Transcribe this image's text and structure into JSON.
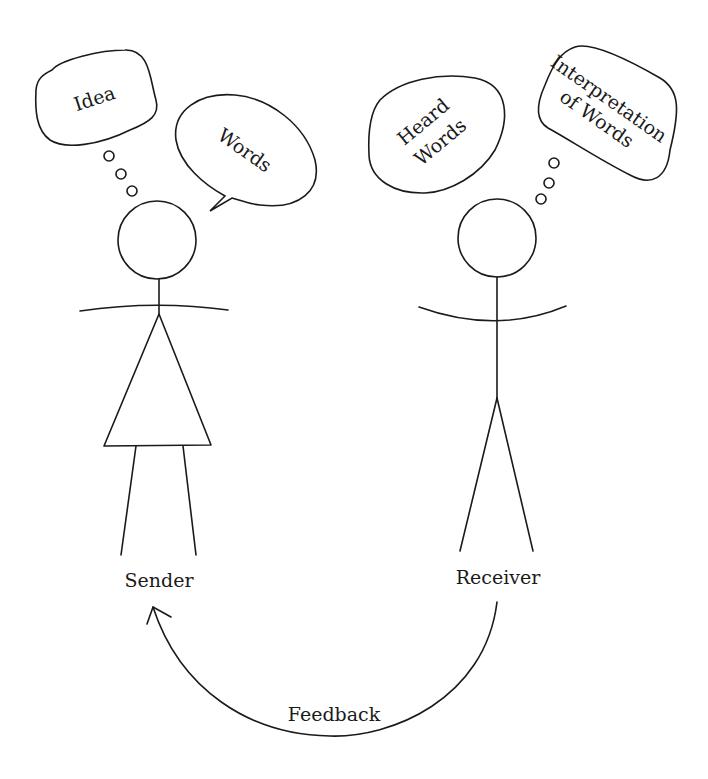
{
  "diagram": {
    "colors": {
      "line": "#1a1a1a",
      "background": "#ffffff"
    },
    "sender": {
      "label": "Sender",
      "thought_bubble": {
        "text": "Idea"
      },
      "speech_bubble": {
        "text": "Words"
      }
    },
    "receiver": {
      "label": "Receiver",
      "heard_bubble": {
        "line1": "Heard",
        "line2": "Words"
      },
      "thought_bubble": {
        "line1": "Interpretation",
        "line2": "of Words"
      }
    },
    "feedback": {
      "label": "Feedback",
      "direction": "receiver-to-sender"
    }
  }
}
